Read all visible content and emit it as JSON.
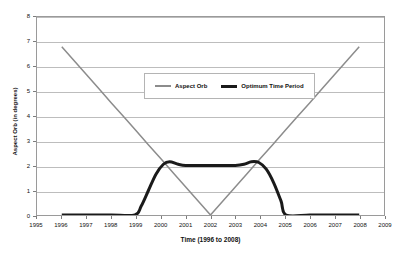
{
  "chart_data": {
    "type": "line",
    "title": "",
    "xlabel": "Time (1996 to 2008)",
    "ylabel": "Aspect Orb (in degrees)",
    "xlim": [
      1995,
      2009
    ],
    "ylim": [
      0,
      8
    ],
    "xticks": [
      1995,
      1996,
      1997,
      1998,
      1999,
      2000,
      2001,
      2002,
      2003,
      2004,
      2005,
      2006,
      2007,
      2008,
      2009
    ],
    "yticks": [
      0,
      1,
      2,
      3,
      4,
      5,
      6,
      7,
      8
    ],
    "grid": "horizontal",
    "legend_position": "upper-center",
    "series": [
      {
        "name": "Aspect Orb",
        "color": "#8c8c8c",
        "line_width": 1.5,
        "x": [
          1996.0,
          1996.5,
          1997.0,
          1997.5,
          1998.0,
          1998.5,
          1999.0,
          1999.5,
          2000.0,
          2000.5,
          2001.0,
          2001.5,
          2002.0,
          2002.5,
          2003.0,
          2003.5,
          2004.0,
          2004.5,
          2005.0,
          2005.5,
          2006.0,
          2006.5,
          2007.0,
          2007.5,
          2008.0
        ],
        "values": [
          6.8,
          6.23,
          5.67,
          5.1,
          4.53,
          3.97,
          3.4,
          2.83,
          2.27,
          1.7,
          1.13,
          0.57,
          0.0,
          0.57,
          1.13,
          1.7,
          2.27,
          2.83,
          3.4,
          3.97,
          4.53,
          5.1,
          5.67,
          6.23,
          6.8
        ]
      },
      {
        "name": "Optimum Time Period",
        "color": "#1a1a1a",
        "line_width": 3,
        "x": [
          1996.0,
          1997.0,
          1998.0,
          1998.95,
          1999.2,
          1999.5,
          1999.8,
          2000.1,
          2000.35,
          2000.7,
          2001.0,
          2001.5,
          2002.0,
          2002.5,
          2003.0,
          2003.35,
          2003.65,
          2003.95,
          2004.25,
          2004.55,
          2004.85,
          2005.05,
          2006.0,
          2007.0,
          2008.0
        ],
        "values": [
          0.0,
          0.0,
          0.0,
          0.0,
          0.35,
          1.0,
          1.65,
          2.05,
          2.15,
          2.05,
          2.0,
          2.0,
          2.0,
          2.0,
          2.0,
          2.05,
          2.15,
          2.12,
          1.85,
          1.3,
          0.55,
          0.0,
          0.0,
          0.0,
          0.0
        ]
      }
    ]
  },
  "legend": {
    "entries": [
      {
        "label": "Aspect Orb",
        "swatch": "thin-gray-line-icon"
      },
      {
        "label": "Optimum Time Period",
        "swatch": "thick-black-line-icon"
      }
    ]
  },
  "colors": {
    "aspect_orb": "#8c8c8c",
    "optimum_time_period": "#1a1a1a",
    "gridline": "#bdbdbd",
    "plot_border": "#9a9a9a",
    "background": "#ffffff"
  }
}
